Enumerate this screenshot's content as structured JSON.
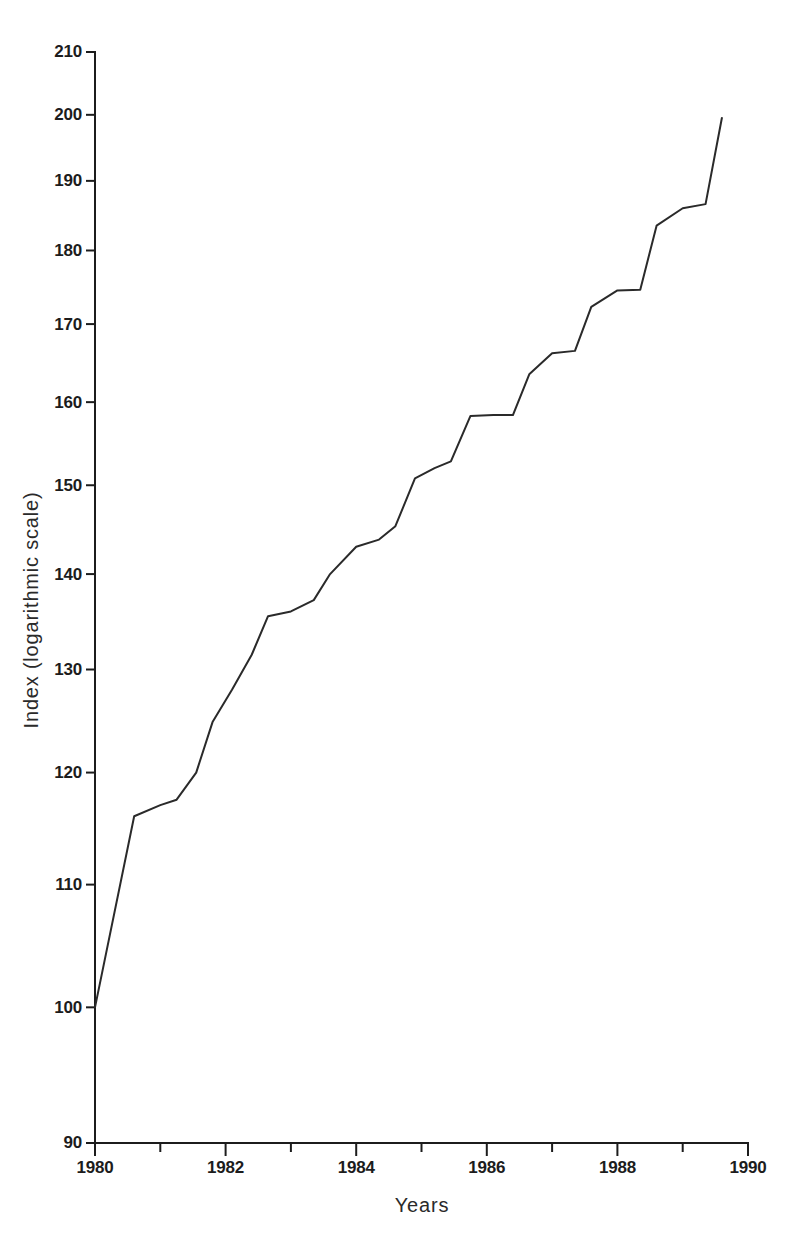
{
  "chart_data": {
    "type": "line",
    "title": "",
    "subtitle": "",
    "xlabel": "Years",
    "ylabel": "Index (logarithmic scale)",
    "yscale": "log",
    "xscale": "linear",
    "ylim": [
      90,
      210
    ],
    "xlim": [
      1980,
      1990
    ],
    "grid": false,
    "legend": null,
    "y_ticks": [
      90,
      100,
      110,
      120,
      130,
      140,
      150,
      160,
      170,
      180,
      190,
      200,
      210
    ],
    "y_tick_labels": [
      "90",
      "100",
      "110",
      "120",
      "130",
      "140",
      "150",
      "160",
      "170",
      "180",
      "190",
      "200",
      "210"
    ],
    "x_ticks": [
      1980,
      1981,
      1982,
      1983,
      1984,
      1985,
      1986,
      1987,
      1988,
      1989,
      1990
    ],
    "x_tick_labels_major": [
      "1980",
      "1982",
      "1984",
      "1986",
      "1988",
      "1990"
    ],
    "x_major_ticks": [
      1980,
      1982,
      1984,
      1986,
      1988,
      1990
    ],
    "line_color": "#2a2a2a",
    "series": [
      {
        "name": "Index",
        "x": [
          1980.0,
          1980.6,
          1981.0,
          1981.25,
          1981.55,
          1981.8,
          1982.1,
          1982.4,
          1982.65,
          1983.0,
          1983.35,
          1983.6,
          1984.0,
          1984.35,
          1984.6,
          1984.9,
          1985.2,
          1985.45,
          1985.75,
          1986.1,
          1986.4,
          1986.65,
          1987.0,
          1987.35,
          1987.6,
          1988.0,
          1988.35,
          1988.6,
          1989.0,
          1989.35,
          1989.6
        ],
        "values": [
          100.0,
          116.0,
          117.0,
          117.5,
          120.0,
          124.8,
          128.0,
          131.5,
          135.5,
          136.0,
          137.2,
          140.0,
          143.0,
          143.8,
          145.3,
          150.8,
          152.0,
          152.8,
          158.3,
          158.4,
          158.4,
          163.5,
          166.2,
          166.5,
          172.3,
          174.5,
          174.6,
          183.5,
          186.0,
          186.6,
          199.5
        ]
      }
    ]
  },
  "axes": {
    "y_axis_title": "Index (logarithmic scale)",
    "x_axis_title": "Years"
  }
}
